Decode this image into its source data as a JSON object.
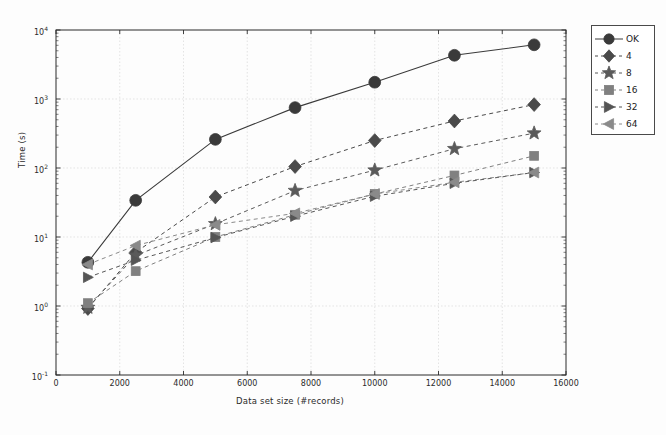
{
  "chart_data": {
    "type": "line",
    "title": "",
    "subtitle": "",
    "xlabel": "Data set size (#records)",
    "ylabel": "Time (s)",
    "xlim": [
      0,
      16000
    ],
    "ylim": [
      0.1,
      10000
    ],
    "yscale": "log",
    "xscale": "linear",
    "grid": true,
    "legend_position": "outside-right-top",
    "xticks": [
      "0",
      "2000",
      "4000",
      "6000",
      "8000",
      "10000",
      "12000",
      "14000",
      "16000"
    ],
    "xtick_values": [
      0,
      2000,
      4000,
      6000,
      8000,
      10000,
      12000,
      14000,
      16000
    ],
    "yticks": [
      "10-1",
      "100",
      "101",
      "102",
      "103",
      "104"
    ],
    "ytick_values": [
      0.1,
      1,
      10,
      100,
      1000,
      10000
    ],
    "ytick_mantissa": [
      "10",
      "10",
      "10",
      "10",
      "10",
      "10"
    ],
    "ytick_exponent": [
      "-1",
      "0",
      "1",
      "2",
      "3",
      "4"
    ],
    "x": [
      1000,
      2500,
      5000,
      7500,
      10000,
      12500,
      15000
    ],
    "series": [
      {
        "name": "OK",
        "marker": "circle",
        "linestyle": "solid",
        "color": "#3a3a3a",
        "values": [
          4.3,
          34,
          260,
          750,
          1750,
          4300,
          6100
        ]
      },
      {
        "name": "4",
        "marker": "diamond",
        "linestyle": "dashed",
        "color": "#4a4a4a",
        "values": [
          0.92,
          6.0,
          38,
          105,
          250,
          480,
          830
        ]
      },
      {
        "name": "8",
        "marker": "star",
        "linestyle": "dashed",
        "color": "#5a5a5a",
        "values": [
          0.95,
          5.4,
          15.5,
          47,
          93,
          190,
          320
        ]
      },
      {
        "name": "16",
        "marker": "square",
        "linestyle": "dashed",
        "color": "#808080",
        "values": [
          1.1,
          3.2,
          10.0,
          21,
          42,
          78,
          150
        ]
      },
      {
        "name": "32",
        "marker": "triangle-right",
        "linestyle": "dashed",
        "color": "#555555",
        "values": [
          2.6,
          4.6,
          9.8,
          20,
          39,
          60,
          86
        ]
      },
      {
        "name": "64",
        "marker": "triangle-left",
        "linestyle": "dashed",
        "color": "#8a8a8a",
        "values": [
          4.0,
          7.5,
          15.0,
          22,
          42,
          62,
          86
        ]
      }
    ]
  },
  "legend": {
    "entries": [
      {
        "label": "OK",
        "marker": "circle"
      },
      {
        "label": "4",
        "marker": "diamond"
      },
      {
        "label": "8",
        "marker": "star"
      },
      {
        "label": "16",
        "marker": "square"
      },
      {
        "label": "32",
        "marker": "triangle-right"
      },
      {
        "label": "64",
        "marker": "triangle-left"
      }
    ]
  },
  "axes": {
    "xlabel": "Data set size (#records)",
    "ylabel": "Time (s)"
  },
  "colors": {
    "axis": "#2b2b2b",
    "grid": "#d9d9d9",
    "marker_dark": "#3c3c3c",
    "marker_mid": "#6a6a6a",
    "marker_light": "#909090",
    "background": "#fdfdfd"
  }
}
